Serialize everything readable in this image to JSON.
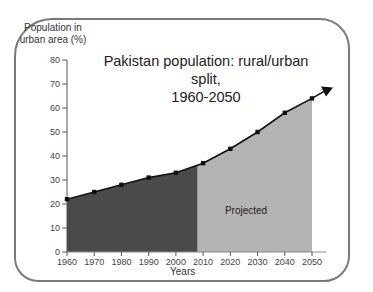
{
  "chart_data": {
    "type": "area",
    "title": "Pakistan population: rural/urban split, 1960-2050",
    "title_line1": "Pakistan population: rural/urban split,",
    "title_line2": "1960-2050",
    "xlabel": "Years",
    "ylabel": "Population in urban area (%)",
    "ylabel_line1": "Population in",
    "ylabel_line2": "urban area (%)",
    "x": [
      1960,
      1970,
      1980,
      1990,
      2000,
      2010,
      2020,
      2030,
      2040,
      2050
    ],
    "values": [
      22,
      25,
      28,
      31,
      33,
      37,
      43,
      50,
      58,
      64
    ],
    "ylim": [
      0,
      80
    ],
    "yticks": [
      0,
      10,
      20,
      30,
      40,
      50,
      60,
      70,
      80
    ],
    "xticks": [
      1960,
      1970,
      1980,
      1990,
      2000,
      2010,
      2020,
      2030,
      2040,
      2050
    ],
    "regions": [
      {
        "name": "Historical",
        "from": 1960,
        "to": 2008,
        "color": "#4a4a4a"
      },
      {
        "name": "Projected",
        "from": 2008,
        "to": 2050,
        "color": "#b3b3b3"
      }
    ],
    "annotations": [
      "Projected"
    ],
    "grid": false,
    "legend": "none"
  }
}
